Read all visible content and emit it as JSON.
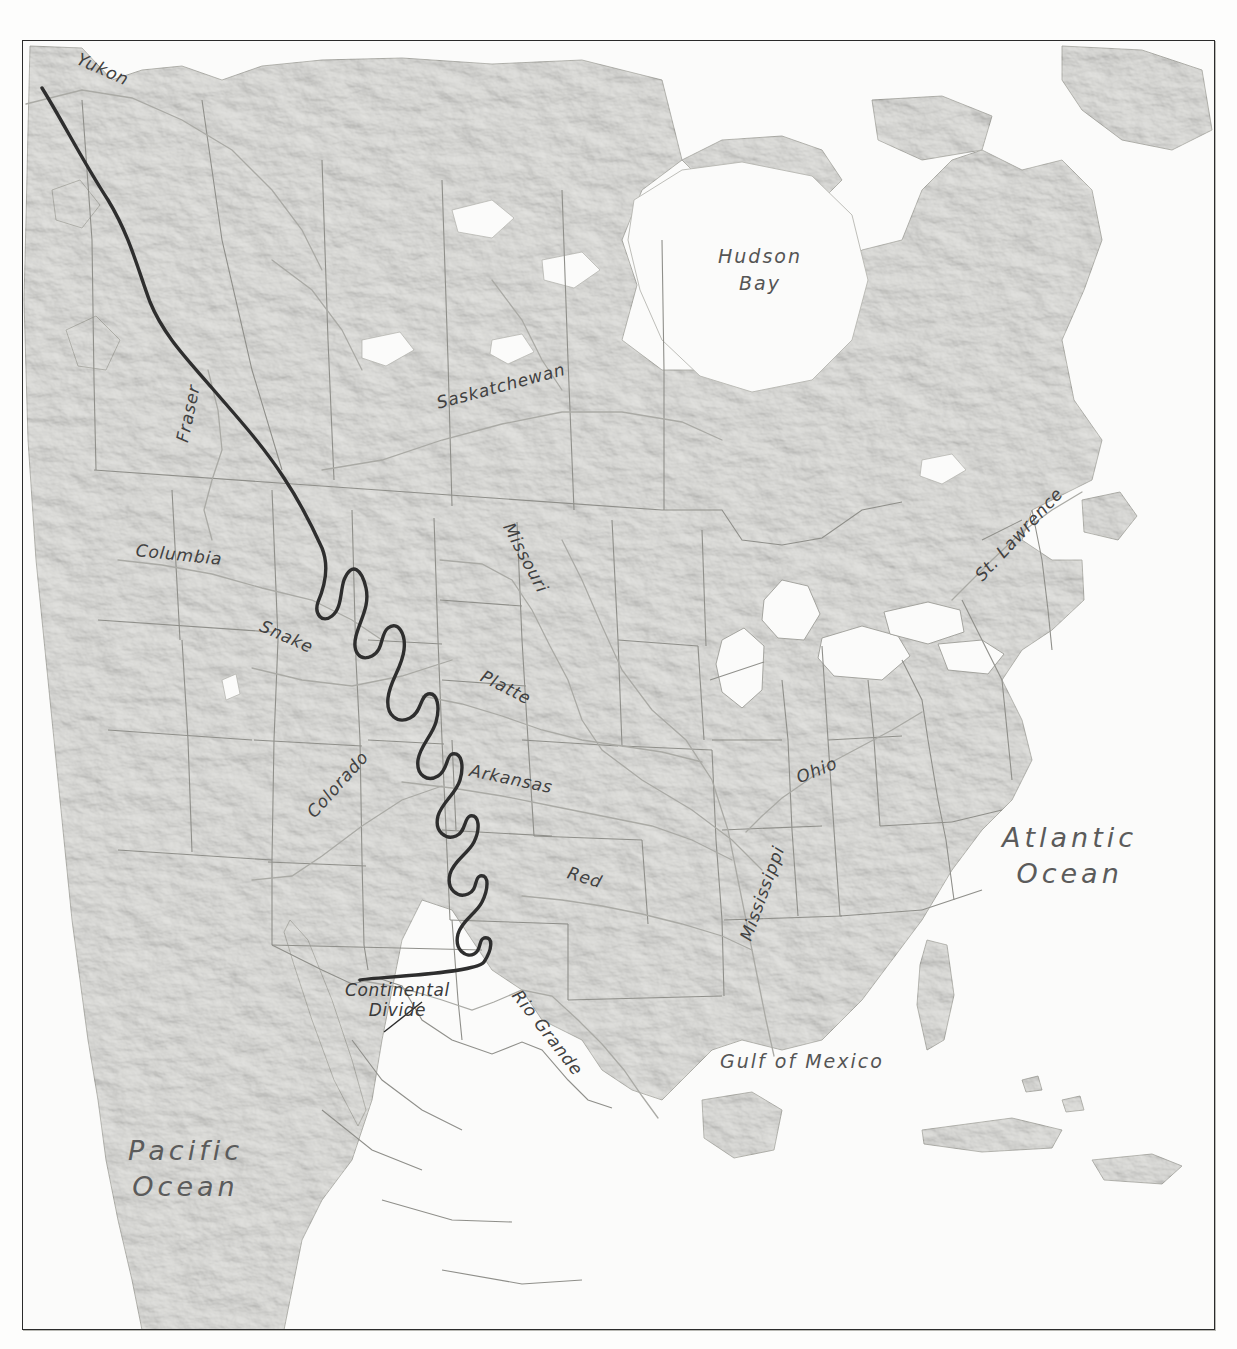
{
  "figure": {
    "kind": "shaded-relief physical map",
    "region": "North America",
    "caption": ""
  },
  "colors": {
    "paper": "#f6f6f4",
    "land": "#e3e3e0",
    "water": "#fafaf9",
    "frame": "#2b2b2b",
    "divide_line": "#2e2e2e",
    "boundary": "#8c8c88",
    "river": "#a9a9a5",
    "label": "#3a3a3a"
  },
  "labels": {
    "oceans": [
      {
        "name": "pacific-ocean",
        "lines": [
          "Pacific",
          "Ocean"
        ],
        "x": 128,
        "y": 1133
      },
      {
        "name": "atlantic-ocean",
        "lines": [
          "Atlantic",
          "Ocean"
        ],
        "x": 1002,
        "y": 820
      }
    ],
    "water_bodies": [
      {
        "name": "hudson-bay",
        "lines": [
          "Hudson",
          "Bay"
        ],
        "x": 718,
        "y": 243
      },
      {
        "name": "gulf-of-mexico",
        "lines": [
          "Gulf of Mexico"
        ],
        "x": 720,
        "y": 1048
      }
    ],
    "rivers": [
      {
        "name": "yukon",
        "text": "Yukon",
        "x": 78,
        "y": 48,
        "rot": 24
      },
      {
        "name": "fraser",
        "text": "Fraser",
        "x": 182,
        "y": 432,
        "rot": -78
      },
      {
        "name": "columbia",
        "text": "Columbia",
        "x": 136,
        "y": 540,
        "rot": 6
      },
      {
        "name": "snake",
        "text": "Snake",
        "x": 261,
        "y": 615,
        "rot": 24
      },
      {
        "name": "saskatchewan",
        "text": "Saskatchewan",
        "x": 437,
        "y": 393,
        "rot": -15
      },
      {
        "name": "missouri",
        "text": "Missouri",
        "x": 508,
        "y": 514,
        "rot": 62
      },
      {
        "name": "platte",
        "text": "Platte",
        "x": 482,
        "y": 665,
        "rot": 27
      },
      {
        "name": "colorado",
        "text": "Colorado",
        "x": 310,
        "y": 805,
        "rot": -48
      },
      {
        "name": "arkansas",
        "text": "Arkansas",
        "x": 470,
        "y": 760,
        "rot": 12
      },
      {
        "name": "red",
        "text": "Red",
        "x": 568,
        "y": 862,
        "rot": 17
      },
      {
        "name": "mississippi",
        "text": "Mississippi",
        "x": 745,
        "y": 930,
        "rot": -70
      },
      {
        "name": "ohio",
        "text": "Ohio",
        "x": 797,
        "y": 768,
        "rot": -22
      },
      {
        "name": "rio-grande",
        "text": "Rio Grande",
        "x": 516,
        "y": 982,
        "rot": 52
      },
      {
        "name": "st-lawrence",
        "text": "St. Lawrence",
        "x": 978,
        "y": 568,
        "rot": -47
      }
    ],
    "annotations": [
      {
        "name": "continental-divide",
        "lines": [
          "Continental",
          "Divide"
        ],
        "x": 345,
        "y": 980
      }
    ]
  }
}
